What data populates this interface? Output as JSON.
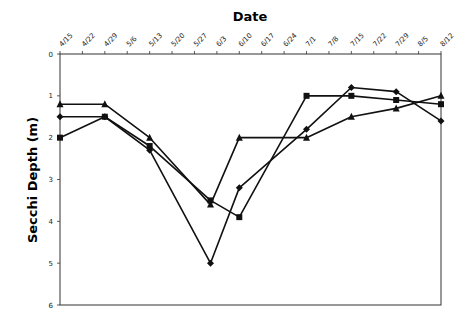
{
  "chart_data": {
    "type": "line",
    "title": "Date",
    "xlabel": "Date",
    "ylabel": "Secchi Depth (m)",
    "ylim": [
      0,
      6
    ],
    "y_inverted": true,
    "yticks": [
      0,
      1,
      2,
      3,
      4,
      5,
      6
    ],
    "grid": false,
    "legend": null,
    "categories": [
      "4/15",
      "4/22",
      "4/29",
      "5/6",
      "5/13",
      "5/20",
      "5/27",
      "6/3",
      "6/10",
      "6/17",
      "6/24",
      "7/1",
      "7/8",
      "7/15",
      "7/22",
      "7/29",
      "8/5",
      "8/12"
    ],
    "series": [
      {
        "name": "Series (triangle markers)",
        "marker": "triangle",
        "points": [
          {
            "x": "4/15",
            "y": 1.2
          },
          {
            "x": "4/29",
            "y": 1.2
          },
          {
            "x": "5/13",
            "y": 2.0
          },
          {
            "x": "6/1",
            "y": 3.6
          },
          {
            "x": "6/10",
            "y": 2.0
          },
          {
            "x": "7/1",
            "y": 2.0
          },
          {
            "x": "7/15",
            "y": 1.5
          },
          {
            "x": "7/29",
            "y": 1.3
          },
          {
            "x": "8/12",
            "y": 1.0
          }
        ]
      },
      {
        "name": "Series (square markers)",
        "marker": "square",
        "points": [
          {
            "x": "4/15",
            "y": 2.0
          },
          {
            "x": "4/29",
            "y": 1.5
          },
          {
            "x": "5/13",
            "y": 2.2
          },
          {
            "x": "6/1",
            "y": 3.5
          },
          {
            "x": "6/10",
            "y": 3.9
          },
          {
            "x": "7/1",
            "y": 1.0
          },
          {
            "x": "7/15",
            "y": 1.0
          },
          {
            "x": "7/29",
            "y": 1.1
          },
          {
            "x": "8/12",
            "y": 1.2
          }
        ]
      },
      {
        "name": "Series (diamond markers)",
        "marker": "diamond",
        "points": [
          {
            "x": "4/15",
            "y": 1.5
          },
          {
            "x": "4/29",
            "y": 1.5
          },
          {
            "x": "5/13",
            "y": 2.3
          },
          {
            "x": "6/1",
            "y": 5.0
          },
          {
            "x": "6/10",
            "y": 3.2
          },
          {
            "x": "7/1",
            "y": 1.8
          },
          {
            "x": "7/15",
            "y": 0.8
          },
          {
            "x": "7/29",
            "y": 0.9
          },
          {
            "x": "8/12",
            "y": 1.6
          }
        ]
      }
    ]
  }
}
